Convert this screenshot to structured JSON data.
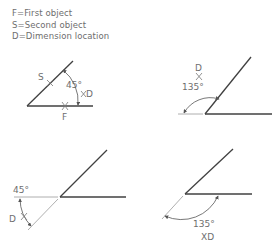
{
  "legend": {
    "items": [
      {
        "label": "F=First object"
      },
      {
        "label": "S=Second object"
      },
      {
        "label": "D=Dimension location"
      }
    ]
  },
  "diagrams": [
    {
      "id": "top-left",
      "angle_label": "45°",
      "first_marker": "F",
      "second_marker": "S",
      "dimension_marker": "D",
      "cross": "X"
    },
    {
      "id": "top-right",
      "angle_label": "135°",
      "dimension_marker": "D",
      "cross": "X"
    },
    {
      "id": "bottom-left",
      "angle_label": "45°",
      "dimension_marker": "D",
      "cross": "X"
    },
    {
      "id": "bottom-right",
      "angle_label": "135°",
      "dimension_marker": "XD"
    }
  ],
  "colors": {
    "object_line": "#404040",
    "thin_line": "#9a9a9a",
    "text": "#6e6e6e"
  }
}
